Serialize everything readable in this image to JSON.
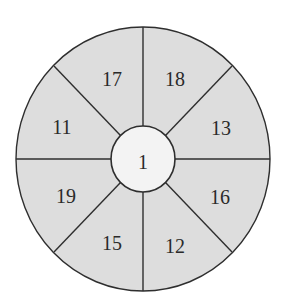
{
  "diagram": {
    "type": "wheel",
    "center_value": "1",
    "segments": [
      {
        "position": "top-left",
        "value": "17"
      },
      {
        "position": "top-right",
        "value": "18"
      },
      {
        "position": "right-upper",
        "value": "13"
      },
      {
        "position": "right-lower",
        "value": "16"
      },
      {
        "position": "bottom-right",
        "value": "12"
      },
      {
        "position": "bottom-left",
        "value": "15"
      },
      {
        "position": "left-lower",
        "value": "19"
      },
      {
        "position": "left-upper",
        "value": "11"
      }
    ],
    "colors": {
      "segment_fill": "#dddddd",
      "hub_fill": "#f3f3f3",
      "stroke": "#2e2e2e"
    }
  }
}
